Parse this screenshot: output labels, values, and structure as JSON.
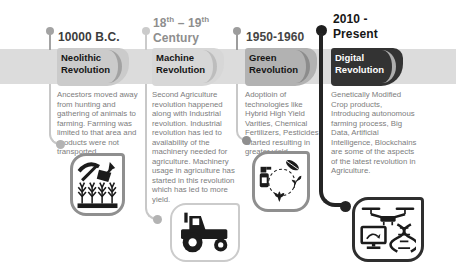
{
  "colors": {
    "band": "#dcdcdc",
    "card_neolithic": "#cbcbcb",
    "card_machine": "#d7d7d7",
    "card_green": "#b2b2b2",
    "card_digital": "#333333",
    "digital_title_text": "#ffffff",
    "body_text": "#7d7d7d"
  },
  "columns": [
    {
      "id": "neolithic",
      "date": "10000 B.C.",
      "title": "Neolithic Revolution",
      "description": "Ancestors moved away from hunting and gathering of animals to farming. Farming was limited to that area and products were not transported.",
      "icon": "farming-tools-wheat-icon"
    },
    {
      "id": "machine",
      "date": {
        "full": "18th – 19th Century",
        "num1": "18",
        "sup1": "th",
        "sep": " – ",
        "num2": "19",
        "sup2": "th",
        "line2": "Century"
      },
      "title": "Machine Revolution",
      "description": "Second Agriculture revolution happened along with Industrial revolution. Industrial revolution has led to availability of the machinery needed for agriculture. Machinery usage in agriculture has started in this revolution which has led to more yield.",
      "icon": "tractor-icon"
    },
    {
      "id": "green",
      "date": "1950-1960",
      "title": "Green Revolution",
      "description": "Adoptioin of technologies like Hybrid High Yield Varities, Chemical Fertilizers, Pesticides Started resulting in greater yield.",
      "icon": "crop-cycle-icon"
    },
    {
      "id": "digital",
      "date": "2010 - Present",
      "title": "Digital Revolution",
      "description": "Genetically Modified Crop products, Introducing autonomous farming process, Big Data, Artificial Intelligence, Blockchains are some of the aspects of the latest revolution in Agriculture.",
      "icon": "drone-dna-monitor-icon"
    }
  ]
}
